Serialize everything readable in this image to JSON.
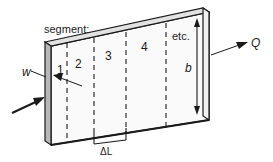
{
  "figure": {
    "title_label": "segment:",
    "segments": [
      {
        "label": "1"
      },
      {
        "label": "2"
      },
      {
        "label": "3"
      },
      {
        "label": "4"
      },
      {
        "label": "etc."
      }
    ],
    "dimensions": {
      "width_label": "w",
      "height_label": "b",
      "segment_length_label": "ΔL"
    },
    "flows": {
      "outlet_label": "Q"
    },
    "colors": {
      "line": "#1a1a1a",
      "face": "#fafafa",
      "slab_edge": "#b8b8b8",
      "background": "#ffffff"
    }
  }
}
